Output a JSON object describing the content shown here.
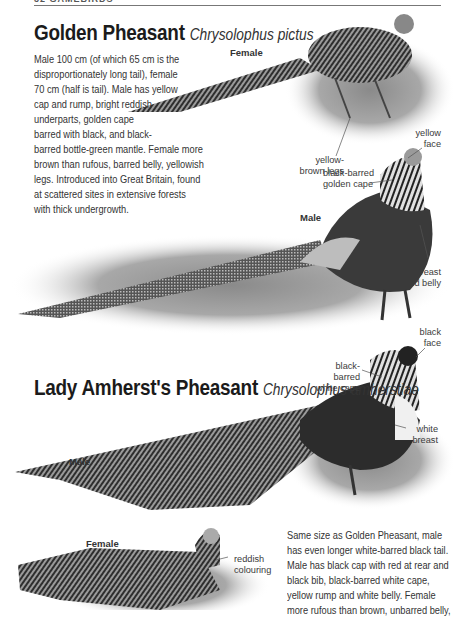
{
  "page_header": {
    "text": "32 GAMEBIRDS"
  },
  "species": [
    {
      "common_name": "Golden Pheasant",
      "scientific_name": "Chrysolophus pictus",
      "description_lines": [
        "Male 100 cm (of which 65 cm is the",
        "disproportionately long tail), female",
        "70 cm (half is tail). Male has yellow",
        "cap and rump, bright reddish",
        "underparts, golden cape",
        "barred with black, and black-",
        "barred bottle-green mantle. Female more",
        "brown than rufous, barred belly, yellowish",
        "legs. Introduced into Great Britain, found",
        "at scattered sites in extensive forests",
        "with thick undergrowth."
      ],
      "images": {
        "female": {
          "caption": "Female",
          "labels": [
            {
              "text_lines": [
                "yellow-",
                "brown legs"
              ]
            }
          ]
        },
        "male": {
          "caption": "Male",
          "labels": [
            {
              "text_lines": [
                "yellow",
                "face"
              ]
            },
            {
              "text_lines": [
                "black-barred",
                "golden cape"
              ]
            },
            {
              "text_lines": [
                "red breast",
                "and belly"
              ]
            }
          ]
        }
      }
    },
    {
      "common_name": "Lady Amherst's Pheasant",
      "scientific_name": "Chrysolophus amherstiae",
      "description_lines": [
        "Same size as Golden Pheasant, male",
        "has even longer white-barred black tail.",
        "Male has black cap with red at rear and",
        "black bib, black-barred white cape,",
        "yellow rump and white belly. Female",
        "more rufous than brown, unbarred belly,"
      ],
      "images": {
        "male": {
          "caption": "Male",
          "labels": [
            {
              "text_lines": [
                "black",
                "face"
              ]
            },
            {
              "text_lines": [
                "black-barred",
                "white cape"
              ]
            },
            {
              "text_lines": [
                "white",
                "breast"
              ]
            }
          ]
        },
        "female": {
          "caption": "Female",
          "labels": [
            {
              "text_lines": [
                "reddish",
                "colouring"
              ]
            }
          ]
        }
      }
    }
  ]
}
